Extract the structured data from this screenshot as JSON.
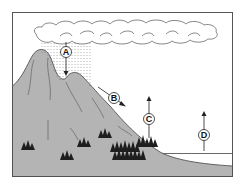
{
  "diagram": {
    "type": "water-cycle",
    "colors": {
      "frame": "#555555",
      "mountain_fill": "#b4b4b4",
      "mountain_stroke": "#444444",
      "tree": "#1e1e1e",
      "cloud_stroke": "#555555",
      "rain": "#666666",
      "water_line": "#444444",
      "arrow": "#222222"
    },
    "labels": [
      {
        "id": "A",
        "text": "A",
        "description": "precipitation arrow from cloud to mountain"
      },
      {
        "id": "B",
        "text": "B",
        "description": "runoff arrow down mountain slope"
      },
      {
        "id": "C",
        "text": "C",
        "description": "upward arrow from trees (transpiration)"
      },
      {
        "id": "D",
        "text": "D",
        "description": "upward arrow from water surface (evaporation)"
      }
    ]
  }
}
